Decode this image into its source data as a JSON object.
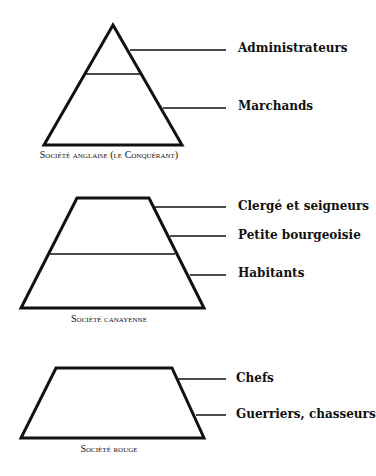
{
  "diagrams": [
    {
      "caption": "Société anglaise (le Conquérant)",
      "labels": [
        "Administrateurs",
        "Marchands"
      ]
    },
    {
      "caption": "Société canayenne",
      "labels": [
        "Clergé et seigneurs",
        "Petite bourgeoisie",
        "Habitants"
      ]
    },
    {
      "caption": "Société rouge",
      "labels": [
        "Chefs",
        "Guerriers, chasseurs"
      ]
    }
  ]
}
